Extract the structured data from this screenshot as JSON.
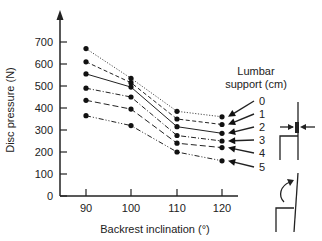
{
  "chart_data": {
    "type": "line",
    "title": "",
    "xlabel": "Backrest inclination (°)",
    "ylabel": "Disc pressure (N)",
    "x": [
      90,
      100,
      110,
      120
    ],
    "xticks": [
      "90",
      "100",
      "110",
      "120"
    ],
    "yticks": [
      "0",
      "100",
      "200",
      "300",
      "400",
      "500",
      "600",
      "700"
    ],
    "ylim": [
      0,
      760
    ],
    "grid": false,
    "legend": {
      "title_line1": "Lumbar",
      "title_line2": "support (cm)",
      "position": "right"
    },
    "series": [
      {
        "name": "0",
        "style": "dotted",
        "values": [
          670,
          535,
          385,
          360
        ]
      },
      {
        "name": "1",
        "style": "dashed",
        "values": [
          610,
          515,
          350,
          325
        ]
      },
      {
        "name": "2",
        "style": "solid",
        "values": [
          555,
          495,
          315,
          285
        ]
      },
      {
        "name": "3",
        "style": "dash-dot",
        "values": [
          490,
          450,
          275,
          250
        ]
      },
      {
        "name": "4",
        "style": "long-dash",
        "values": [
          435,
          395,
          240,
          220
        ]
      },
      {
        "name": "5",
        "style": "dash-dot-dot",
        "values": [
          365,
          320,
          200,
          160
        ]
      }
    ],
    "annotations": [
      "lumbar support chair diagram",
      "backrest inclination chair diagram"
    ]
  },
  "colors": {
    "ink": "#222222",
    "background": "#ffffff"
  }
}
